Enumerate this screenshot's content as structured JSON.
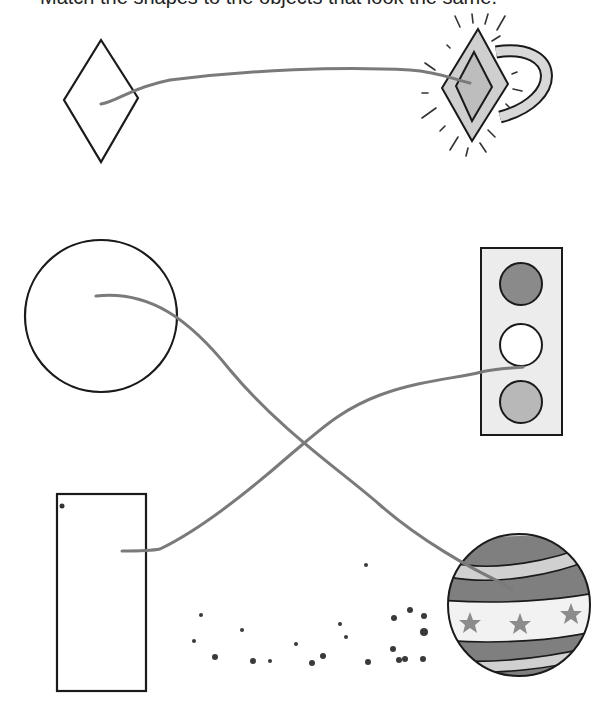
{
  "worksheet": {
    "header_partial": "Match the shapes to the objects that look the same.",
    "left_shapes": [
      {
        "name": "diamond",
        "label": "Diamond"
      },
      {
        "name": "circle",
        "label": "Circle"
      },
      {
        "name": "rectangle",
        "label": "Rectangle"
      }
    ],
    "right_objects": [
      {
        "name": "diamond-ring",
        "label": "Diamond ring",
        "matches": "diamond"
      },
      {
        "name": "traffic-light",
        "label": "Traffic light",
        "matches": "rectangle"
      },
      {
        "name": "striped-ball",
        "label": "Striped ball with stars",
        "matches": "circle"
      }
    ],
    "connections": [
      {
        "from": "diamond",
        "to": "diamond-ring"
      },
      {
        "from": "circle",
        "to": "striped-ball"
      },
      {
        "from": "rectangle",
        "to": "traffic-light"
      }
    ],
    "colors": {
      "outline": "#1a1a1a",
      "line": "#7a7a7a",
      "fill_light": "#d9d9d9",
      "fill_mid": "#9a9a9a",
      "fill_dark": "#7d7d7d"
    }
  }
}
